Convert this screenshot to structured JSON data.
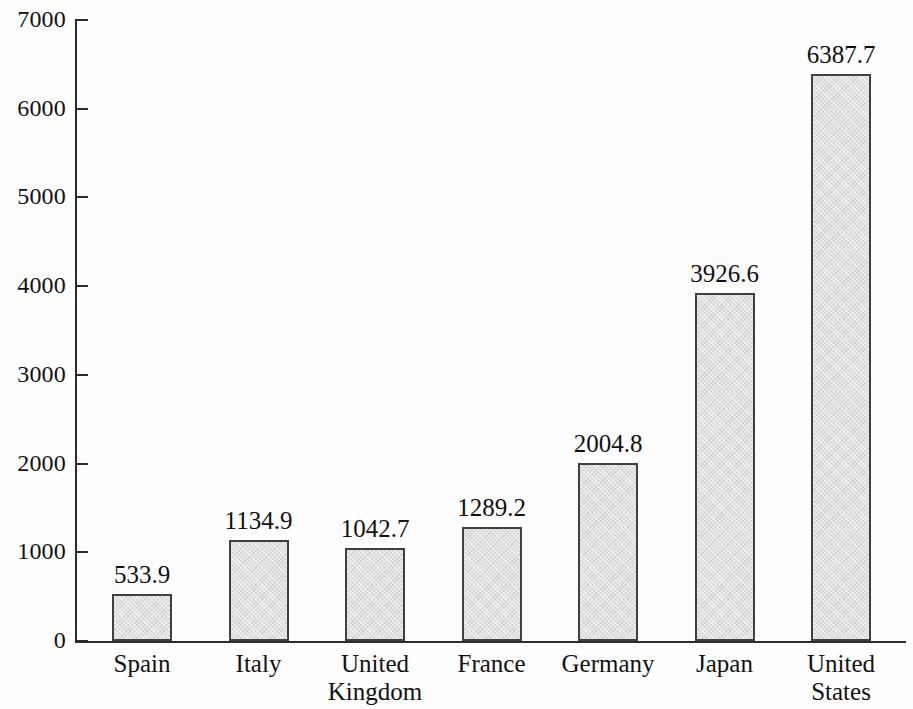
{
  "chart_data": {
    "type": "bar",
    "title": "",
    "subtitle": "",
    "xlabel": "",
    "ylabel": "",
    "categories": [
      "Spain",
      "Italy",
      "United\nKingdom",
      "France",
      "Germany",
      "Japan",
      "United\nStates"
    ],
    "values": [
      533.9,
      1134.9,
      1042.7,
      1289.2,
      2004.8,
      3926.6,
      6387.7
    ],
    "value_labels": [
      "533.9",
      "1134.9",
      "1042.7",
      "1289.2",
      "2004.8",
      "3926.6",
      "6387.7"
    ],
    "ylim": [
      0,
      7000
    ],
    "ytick_values": [
      0,
      1000,
      2000,
      3000,
      4000,
      5000,
      6000,
      7000
    ],
    "ytick_labels": [
      "0",
      "1000",
      "2000",
      "3000",
      "4000",
      "5000",
      "6000",
      "7000"
    ],
    "grid": false,
    "legend": null,
    "legend_position": "none",
    "bar_fill_color": "#e2e2e2",
    "bar_border_color": "#404040",
    "axis_color": "#2b2b2b",
    "text_color": "#111111",
    "background_color": "#fefefe"
  }
}
